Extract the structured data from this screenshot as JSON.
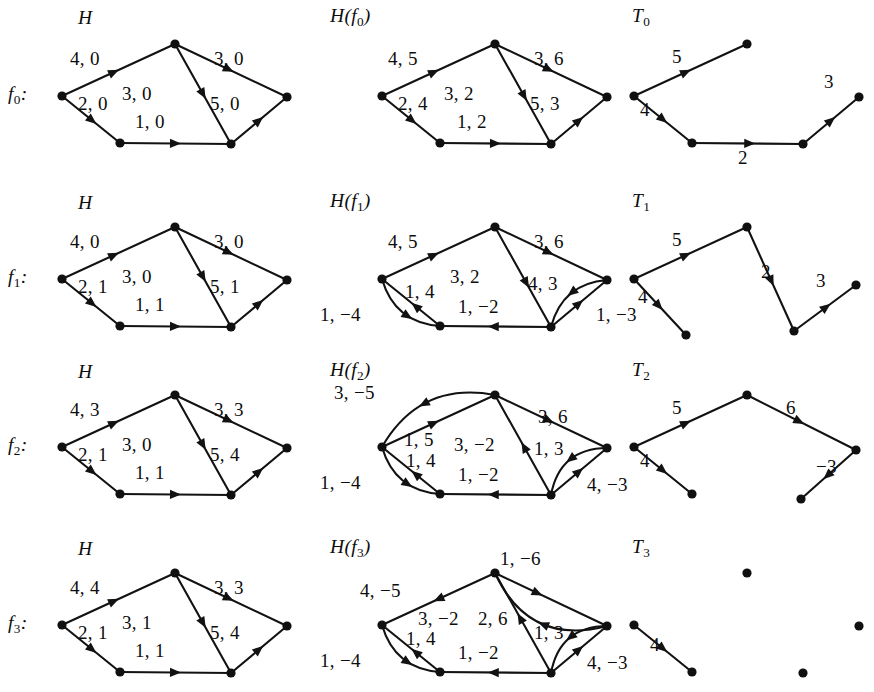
{
  "figure": {
    "title_col_1": "H",
    "columns": [
      "H",
      "H(f)",
      "T"
    ],
    "background": "#ffffff",
    "ink": "#121212"
  },
  "rows": [
    {
      "id": "row0",
      "row_label": "f₀:",
      "row_label_base": "f",
      "row_label_sub": "0",
      "caption_H": "H",
      "caption_Hf": "H(f₀)",
      "caption_Hf_base": "H(f",
      "caption_Hf_sub": "0",
      "caption_Hf_tail": ")",
      "caption_T": "T₀",
      "caption_T_base": "T",
      "caption_T_sub": "0",
      "H_edges": [
        {
          "name": "s-top",
          "label": "4, 0"
        },
        {
          "name": "s-bl",
          "label": "2, 0"
        },
        {
          "name": "top-br",
          "label": "3, 0"
        },
        {
          "name": "top-t",
          "label": "3, 0"
        },
        {
          "name": "bl-br",
          "label": "1, 0"
        },
        {
          "name": "br-t",
          "label": "5, 0"
        }
      ],
      "Hf_edges": [
        {
          "name": "s-top",
          "label": "4, 5"
        },
        {
          "name": "s-bl",
          "label": "2, 4"
        },
        {
          "name": "top-br",
          "label": "3, 2"
        },
        {
          "name": "top-t",
          "label": "3, 6"
        },
        {
          "name": "bl-br",
          "label": "1, 2"
        },
        {
          "name": "br-t",
          "label": "5, 3"
        }
      ],
      "T_edges": [
        {
          "name": "s-top",
          "label": "5"
        },
        {
          "name": "s-bl",
          "label": "4"
        },
        {
          "name": "bl-br",
          "label": "2"
        },
        {
          "name": "br-t",
          "label": "3"
        }
      ]
    },
    {
      "id": "row1",
      "row_label": "f₁:",
      "row_label_base": "f",
      "row_label_sub": "1",
      "caption_H": "H",
      "caption_Hf": "H(f₁)",
      "caption_Hf_base": "H(f",
      "caption_Hf_sub": "1",
      "caption_Hf_tail": ")",
      "caption_T": "T₁",
      "caption_T_base": "T",
      "caption_T_sub": "1",
      "H_edges": [
        {
          "name": "s-top",
          "label": "4, 0"
        },
        {
          "name": "s-bl",
          "label": "2, 1"
        },
        {
          "name": "top-br",
          "label": "3, 0"
        },
        {
          "name": "top-t",
          "label": "3, 0"
        },
        {
          "name": "bl-br",
          "label": "1, 1"
        },
        {
          "name": "br-t",
          "label": "5, 1"
        }
      ],
      "Hf_edges": [
        {
          "name": "s-top",
          "label": "4, 5"
        },
        {
          "name": "top-br",
          "label": "3, 2"
        },
        {
          "name": "top-t",
          "label": "3, 6"
        },
        {
          "name": "bl-s",
          "label": "1, 4"
        },
        {
          "name": "s-bl-curve",
          "label": "1, −4"
        },
        {
          "name": "br-bl",
          "label": "1, −2"
        },
        {
          "name": "br-t",
          "label": "4, 3"
        },
        {
          "name": "t-br-curve",
          "label": "1, −3"
        }
      ],
      "T_edges": [
        {
          "name": "s-top",
          "label": "5"
        },
        {
          "name": "s-bl",
          "label": "4"
        },
        {
          "name": "top-br",
          "label": "2"
        },
        {
          "name": "br-t",
          "label": "3"
        }
      ]
    },
    {
      "id": "row2",
      "row_label": "f₂:",
      "row_label_base": "f",
      "row_label_sub": "2",
      "caption_H": "H",
      "caption_Hf": "H(f₂)",
      "caption_Hf_base": "H(f",
      "caption_Hf_sub": "2",
      "caption_Hf_tail": ")",
      "caption_T": "T₂",
      "caption_T_base": "T",
      "caption_T_sub": "2",
      "H_edges": [
        {
          "name": "s-top",
          "label": "4, 3"
        },
        {
          "name": "s-bl",
          "label": "2, 1"
        },
        {
          "name": "top-br",
          "label": "3, 3"
        },
        {
          "name": "top-t",
          "label": "3, 0"
        },
        {
          "name": "bl-br",
          "label": "1, 1"
        },
        {
          "name": "br-t",
          "label": "5, 4"
        }
      ],
      "Hf_edges": [
        {
          "name": "top-s-curve",
          "label": "3, −5"
        },
        {
          "name": "s-top",
          "label": "1, 5"
        },
        {
          "name": "br-top",
          "label": "3, −2"
        },
        {
          "name": "top-t",
          "label": "3, 6"
        },
        {
          "name": "bl-s",
          "label": "1, 4"
        },
        {
          "name": "s-bl-curve",
          "label": "1, −4"
        },
        {
          "name": "br-bl",
          "label": "1, −2"
        },
        {
          "name": "br-t",
          "label": "1, 3"
        },
        {
          "name": "t-br-curve",
          "label": "4, −3"
        }
      ],
      "T_edges": [
        {
          "name": "s-top",
          "label": "5"
        },
        {
          "name": "s-bl",
          "label": "4"
        },
        {
          "name": "top-t",
          "label": "6"
        },
        {
          "name": "t-br",
          "label": "−3"
        }
      ]
    },
    {
      "id": "row3",
      "row_label": "f₃:",
      "row_label_base": "f",
      "row_label_sub": "3",
      "caption_H": "H",
      "caption_Hf": "H(f₃)",
      "caption_Hf_base": "H(f",
      "caption_Hf_sub": "3",
      "caption_Hf_tail": ")",
      "caption_T": "T₃",
      "caption_T_base": "T",
      "caption_T_sub": "3",
      "H_edges": [
        {
          "name": "s-top",
          "label": "4, 4"
        },
        {
          "name": "s-bl",
          "label": "2, 1"
        },
        {
          "name": "top-br",
          "label": "3, 3"
        },
        {
          "name": "top-t",
          "label": "3, 1"
        },
        {
          "name": "bl-br",
          "label": "1, 1"
        },
        {
          "name": "br-t",
          "label": "5, 4"
        }
      ],
      "Hf_edges": [
        {
          "name": "top-s",
          "label": "4, −5"
        },
        {
          "name": "t-top-curve",
          "label": "1, −6"
        },
        {
          "name": "br-top",
          "label": "3, −2"
        },
        {
          "name": "top-t",
          "label": "2, 6"
        },
        {
          "name": "bl-s",
          "label": "1, 4"
        },
        {
          "name": "s-bl-curve",
          "label": "1, −4"
        },
        {
          "name": "br-bl",
          "label": "1, −2"
        },
        {
          "name": "br-t",
          "label": "1, 3"
        },
        {
          "name": "t-br-curve",
          "label": "4, −3"
        }
      ],
      "T_edges": [
        {
          "name": "s-bl",
          "label": "4"
        }
      ]
    }
  ]
}
